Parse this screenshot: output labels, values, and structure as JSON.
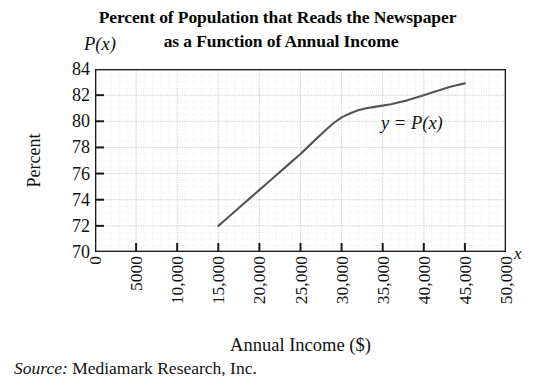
{
  "chart_data": {
    "type": "line",
    "title": "Percent of Population that Reads the Newspaper as a Function of Annual Income",
    "title_line_1": "Percent of Population that Reads the Newspaper",
    "title_line_2": "as a Function of Annual Income",
    "xlabel": "Annual Income ($)",
    "ylabel": "Percent",
    "x_axis_symbol": "x",
    "y_axis_symbol": "P(x)",
    "curve_label": "y = P(x)",
    "source_label": "Source:",
    "source_text": "Mediamark Research, Inc.",
    "grid": true,
    "legend_position": "inline-annotation",
    "xlim": [
      0,
      50000
    ],
    "ylim": [
      70,
      84
    ],
    "xticks": [
      0,
      5000,
      10000,
      15000,
      20000,
      25000,
      30000,
      35000,
      40000,
      45000,
      50000
    ],
    "xtick_labels": [
      "0",
      "5000",
      "10,000",
      "15,000",
      "20,000",
      "25,000",
      "30,000",
      "35,000",
      "40,000",
      "45,000",
      "50,000"
    ],
    "yticks": [
      70,
      72,
      74,
      76,
      78,
      80,
      82,
      84
    ],
    "ytick_labels": [
      "70",
      "72",
      "74",
      "76",
      "78",
      "80",
      "82",
      "84"
    ],
    "series": [
      {
        "name": "y = P(x)",
        "color": "#555555",
        "x": [
          15000,
          16000,
          17000,
          18000,
          19000,
          20000,
          21000,
          22000,
          23000,
          24000,
          25000,
          26000,
          27000,
          28000,
          29000,
          30000,
          31000,
          32000,
          33000,
          34000,
          35000,
          36000,
          37000,
          38000,
          39000,
          40000,
          41000,
          42000,
          43000,
          44000,
          45000
        ],
        "y": [
          72.0,
          72.55,
          73.1,
          73.65,
          74.2,
          74.75,
          75.3,
          75.85,
          76.4,
          76.95,
          77.5,
          78.1,
          78.7,
          79.3,
          79.85,
          80.3,
          80.6,
          80.85,
          81.0,
          81.1,
          81.2,
          81.3,
          81.45,
          81.6,
          81.8,
          82.0,
          82.2,
          82.4,
          82.6,
          82.75,
          82.9
        ]
      }
    ]
  },
  "colors": {
    "curve": "#555555",
    "axis": "#1a1a1a",
    "grid_major": "#bdbdbd",
    "grid_minor": "#dcdcdc",
    "background": "#ffffff"
  }
}
